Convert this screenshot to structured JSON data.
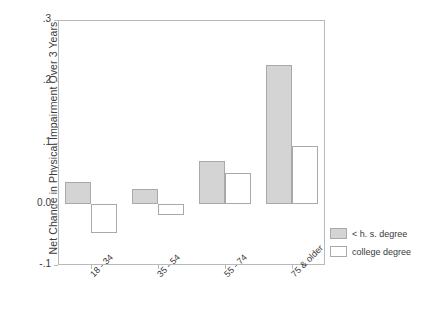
{
  "chart_data": {
    "type": "bar",
    "title": "",
    "xlabel": "",
    "ylabel": "Net Change in Physical Impairment Over 3 Years",
    "categories": [
      "18 - 34",
      "35 - 54",
      "55 - 74",
      "75 & older"
    ],
    "series": [
      {
        "name": "< h. s. degree",
        "values": [
          0.035,
          0.024,
          0.069,
          0.227
        ],
        "fill": "#d4d4d4"
      },
      {
        "name": "college degree",
        "values": [
          -0.048,
          -0.019,
          0.051,
          0.094
        ],
        "fill": "#ffffff"
      }
    ],
    "ylim": [
      -0.1,
      0.3
    ],
    "yticks": [
      0.3,
      0.2,
      0.1,
      0.0,
      -0.1
    ],
    "ytick_labels": [
      ".3",
      ".2",
      ".1",
      "0.0",
      "-.1"
    ],
    "grid": false,
    "legend_position": "bottom-right-outside",
    "zero_line": 0.0,
    "axis_color": "#b9b9b9",
    "bar_border_color": "#a9a9a9"
  },
  "legend": {
    "entries": [
      {
        "label": "< h. s. degree"
      },
      {
        "label": "college degree"
      }
    ]
  }
}
